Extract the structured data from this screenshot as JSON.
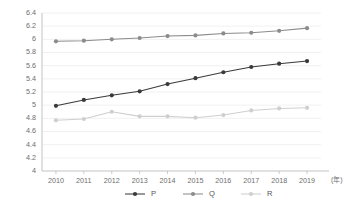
{
  "chart_data": {
    "type": "line",
    "title": "",
    "subtitle": "",
    "xlabel": "",
    "ylabel": "",
    "x_unit_label": "(年)",
    "categories": [
      "2010",
      "2011",
      "2012",
      "2013",
      "2014",
      "2015",
      "2016",
      "2017",
      "2018",
      "2019"
    ],
    "x": [
      2010,
      2011,
      2012,
      2013,
      2014,
      2015,
      2016,
      2017,
      2018,
      2019
    ],
    "ylim": [
      4,
      6.4
    ],
    "xlim": [
      2009.5,
      2019.5
    ],
    "y_ticks": [
      "4",
      "4.2",
      "4.4",
      "4.6",
      "4.8",
      "5",
      "5.2",
      "5.4",
      "5.6",
      "5.8",
      "6",
      "6.2",
      "6.4"
    ],
    "y_tick_values": [
      4,
      4.2,
      4.4,
      4.6,
      4.8,
      5,
      5.2,
      5.4,
      5.6,
      5.8,
      6,
      6.2,
      6.4
    ],
    "grid": true,
    "grid_axis": "y",
    "legend_position": "bottom",
    "markers": "circle",
    "series": [
      {
        "name": "P",
        "color": "#3a3a3a",
        "values": [
          4.99,
          5.08,
          5.15,
          5.21,
          5.32,
          5.41,
          5.5,
          5.58,
          5.63,
          5.67
        ]
      },
      {
        "name": "Q",
        "color": "#8c8c8c",
        "values": [
          5.97,
          5.98,
          6.0,
          6.02,
          6.05,
          6.06,
          6.09,
          6.1,
          6.13,
          6.17
        ]
      },
      {
        "name": "R",
        "color": "#cfcfcf",
        "values": [
          4.77,
          4.79,
          4.9,
          4.83,
          4.83,
          4.81,
          4.85,
          4.92,
          4.95,
          4.96
        ]
      }
    ]
  },
  "style": {
    "background": "#ffffff",
    "grid_color": "#ebebeb",
    "axis_color": "#b4b4b4",
    "tick_label_color": "#6e6e6e",
    "legend_label_color": "#555555"
  },
  "legend": {
    "items": [
      {
        "label": "P",
        "color": "#3a3a3a"
      },
      {
        "label": "Q",
        "color": "#8c8c8c"
      },
      {
        "label": "R",
        "color": "#cfcfcf"
      }
    ]
  }
}
